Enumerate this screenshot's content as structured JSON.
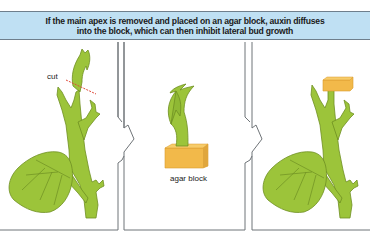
{
  "header": {
    "line1": "If the main apex is removed and placed on an agar block, auxin diffuses",
    "line2": "into the block, which can then inhibit lateral bud growth"
  },
  "panels": [
    {
      "id": "panel-1",
      "labels": {
        "cut": "cut"
      },
      "description": "plant with cut line below apex"
    },
    {
      "id": "panel-2",
      "labels": {
        "agar_block": "agar block"
      },
      "description": "removed apex on agar block"
    },
    {
      "id": "panel-3",
      "labels": {},
      "description": "agar block placed on cut stem"
    }
  ],
  "colors": {
    "header_bg": "#bfe0f3",
    "plant_green": "#9cc43a",
    "plant_outline": "#6e8f22",
    "agar_yellow": "#f2b94a",
    "cut_line": "#e04a3a",
    "panel_border": "#6f7478"
  }
}
